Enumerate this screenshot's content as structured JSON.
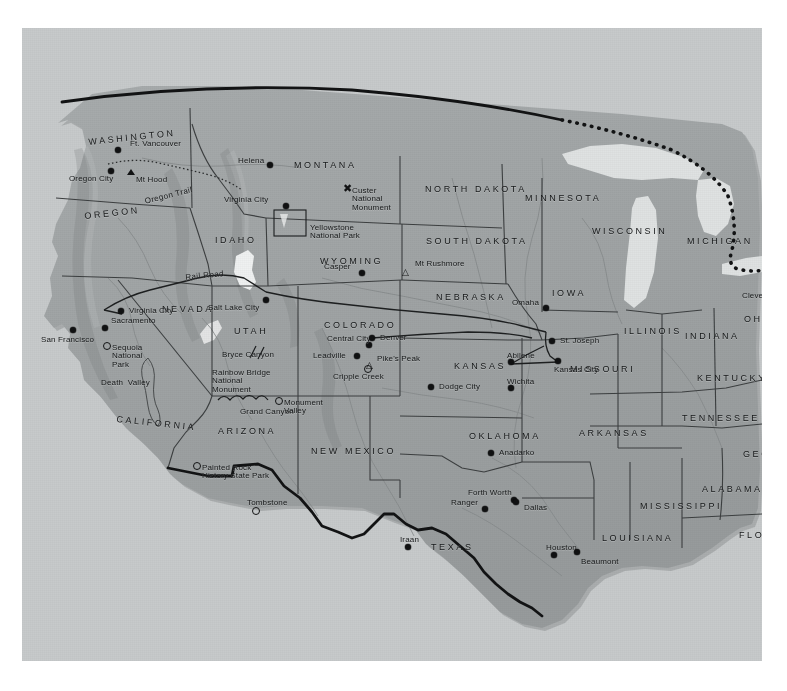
{
  "map": {
    "title": "Relief map of the western and central United States",
    "panel": {
      "x": 22,
      "y": 28,
      "w": 740,
      "h": 633
    },
    "colors": {
      "land": "#9fa3a4",
      "ocean": "#c9cccd",
      "paper": "#b9bcbd",
      "border_line": "#121314",
      "state_line": "#3a3d3e",
      "river": "#8e9293",
      "lake": "#e8eaea",
      "label": "#17191a"
    },
    "states": [
      {
        "name": "WASHINGTON",
        "x": 66,
        "y": 110,
        "rot": -8,
        "size": "big"
      },
      {
        "name": "OREGON",
        "x": 62,
        "y": 184,
        "rot": -4,
        "size": "big"
      },
      {
        "name": "IDAHO",
        "x": 193,
        "y": 208,
        "rot": 0,
        "size": "big"
      },
      {
        "name": "MONTANA",
        "x": 272,
        "y": 133,
        "rot": 0,
        "size": "big"
      },
      {
        "name": "NORTH DAKOTA",
        "x": 403,
        "y": 157,
        "rot": 0,
        "size": "big"
      },
      {
        "name": "SOUTH DAKOTA",
        "x": 404,
        "y": 209,
        "rot": 0,
        "size": "big"
      },
      {
        "name": "MINNESOTA",
        "x": 503,
        "y": 166,
        "rot": 0,
        "size": "big"
      },
      {
        "name": "WISCONSIN",
        "x": 570,
        "y": 199,
        "rot": 0,
        "size": "big"
      },
      {
        "name": "MICHIGAN",
        "x": 665,
        "y": 209,
        "rot": 0,
        "size": "big"
      },
      {
        "name": "WYOMING",
        "x": 298,
        "y": 229,
        "rot": 0,
        "size": "big"
      },
      {
        "name": "NEBRASKA",
        "x": 414,
        "y": 265,
        "rot": 0,
        "size": "big"
      },
      {
        "name": "IOWA",
        "x": 530,
        "y": 261,
        "rot": 0,
        "size": "big"
      },
      {
        "name": "ILLINOIS",
        "x": 602,
        "y": 299,
        "rot": 0,
        "size": "big"
      },
      {
        "name": "INDIANA",
        "x": 663,
        "y": 304,
        "rot": 0,
        "size": "big"
      },
      {
        "name": "OHIO",
        "x": 722,
        "y": 287,
        "rot": 0,
        "size": "big"
      },
      {
        "name": "NEVADA",
        "x": 140,
        "y": 277,
        "rot": 0,
        "size": "big"
      },
      {
        "name": "UTAH",
        "x": 212,
        "y": 299,
        "rot": 0,
        "size": "big"
      },
      {
        "name": "COLORADO",
        "x": 302,
        "y": 293,
        "rot": 0,
        "size": "big"
      },
      {
        "name": "KANSAS",
        "x": 432,
        "y": 334,
        "rot": 0,
        "size": "big"
      },
      {
        "name": "MISSOURI",
        "x": 548,
        "y": 337,
        "rot": 0,
        "size": "big"
      },
      {
        "name": "KENTUCKY",
        "x": 675,
        "y": 346,
        "rot": 0,
        "size": "big"
      },
      {
        "name": "CALIFORNIA",
        "x": 95,
        "y": 387,
        "rot": 5,
        "size": "big"
      },
      {
        "name": "ARIZONA",
        "x": 196,
        "y": 399,
        "rot": 0,
        "size": "big"
      },
      {
        "name": "NEW MEXICO",
        "x": 289,
        "y": 419,
        "rot": 0,
        "size": "big"
      },
      {
        "name": "OKLAHOMA",
        "x": 447,
        "y": 404,
        "rot": 0,
        "size": "big"
      },
      {
        "name": "ARKANSAS",
        "x": 557,
        "y": 401,
        "rot": 0,
        "size": "big"
      },
      {
        "name": "TENNESSEE",
        "x": 660,
        "y": 386,
        "rot": 0,
        "size": "big"
      },
      {
        "name": "GEORGIA",
        "x": 721,
        "y": 422,
        "rot": 0,
        "size": "big"
      },
      {
        "name": "ALABAMA",
        "x": 680,
        "y": 457,
        "rot": 0,
        "size": "big"
      },
      {
        "name": "MISSISSIPPI",
        "x": 618,
        "y": 474,
        "rot": 0,
        "size": "big"
      },
      {
        "name": "LOUISIANA",
        "x": 580,
        "y": 506,
        "rot": 0,
        "size": "big"
      },
      {
        "name": "FLORIDA",
        "x": 717,
        "y": 503,
        "rot": 0,
        "size": "big"
      },
      {
        "name": "TEXAS",
        "x": 409,
        "y": 515,
        "rot": 0,
        "size": "big"
      }
    ],
    "cities": [
      {
        "name": "Ft. Vancouver",
        "x": 96,
        "y": 122,
        "lx": 12,
        "ly": -10,
        "marker": "dot"
      },
      {
        "name": "Oregon City",
        "x": 89,
        "y": 143,
        "lx": -42,
        "ly": 4,
        "marker": "dot"
      },
      {
        "name": "Mt Hood",
        "x": 108,
        "y": 144,
        "lx": 6,
        "ly": 4,
        "marker": "triangle"
      },
      {
        "name": "Helena",
        "x": 248,
        "y": 137,
        "lx": -32,
        "ly": -8,
        "marker": "dot"
      },
      {
        "name": "Virginia City",
        "x": 264,
        "y": 178,
        "lx": -62,
        "ly": -10,
        "marker": "dot"
      },
      {
        "name": "Casper",
        "x": 340,
        "y": 245,
        "lx": -38,
        "ly": -10,
        "marker": "dot"
      },
      {
        "name": "Mt Rushmore",
        "x": 383,
        "y": 236,
        "lx": 10,
        "ly": -4,
        "marker": "triangle-open"
      },
      {
        "name": "Salt Lake City",
        "x": 244,
        "y": 272,
        "lx": -58,
        "ly": 4,
        "marker": "dot"
      },
      {
        "name": "Virginia City",
        "x": 99,
        "y": 283,
        "lx": 8,
        "ly": -4,
        "marker": "dot"
      },
      {
        "name": "Sacramento",
        "x": 83,
        "y": 300,
        "lx": 6,
        "ly": -11,
        "marker": "dot"
      },
      {
        "name": "San Francisco",
        "x": 51,
        "y": 302,
        "lx": -32,
        "ly": 6,
        "marker": "dot"
      },
      {
        "name": "Omaha",
        "x": 524,
        "y": 280,
        "lx": -34,
        "ly": -9,
        "marker": "dot"
      },
      {
        "name": "St. Joseph",
        "x": 530,
        "y": 313,
        "lx": 8,
        "ly": -4,
        "marker": "dot"
      },
      {
        "name": "Kansas City",
        "x": 536,
        "y": 333,
        "lx": -4,
        "ly": 5,
        "marker": "dot"
      },
      {
        "name": "Abilene",
        "x": 489,
        "y": 334,
        "lx": -4,
        "ly": -10,
        "marker": "dot"
      },
      {
        "name": "Wichita",
        "x": 489,
        "y": 360,
        "lx": -4,
        "ly": -10,
        "marker": "dot"
      },
      {
        "name": "Dodge City",
        "x": 409,
        "y": 359,
        "lx": 8,
        "ly": -4,
        "marker": "dot"
      },
      {
        "name": "Central City",
        "x": 347,
        "y": 317,
        "lx": -42,
        "ly": -10,
        "marker": "dot"
      },
      {
        "name": "Denver",
        "x": 350,
        "y": 310,
        "lx": 8,
        "ly": 0,
        "marker": "dot"
      },
      {
        "name": "Leadville",
        "x": 335,
        "y": 328,
        "lx": -44,
        "ly": -4,
        "marker": "dot"
      },
      {
        "name": "Pike's Peak",
        "x": 347,
        "y": 329,
        "lx": 8,
        "ly": -2,
        "marker": "triangle-open"
      },
      {
        "name": "Cripple Creek",
        "x": 345,
        "y": 340,
        "lx": -34,
        "ly": 5,
        "marker": "ring"
      },
      {
        "name": "Anadarko",
        "x": 469,
        "y": 425,
        "lx": 8,
        "ly": -4,
        "marker": "dot"
      },
      {
        "name": "Forth Worth",
        "x": 492,
        "y": 472,
        "lx": -46,
        "ly": -11,
        "marker": "dot"
      },
      {
        "name": "Ranger",
        "x": 463,
        "y": 481,
        "lx": -34,
        "ly": -10,
        "marker": "dot"
      },
      {
        "name": "Dallas",
        "x": 494,
        "y": 474,
        "lx": 8,
        "ly": 2,
        "marker": "dot"
      },
      {
        "name": "Houston",
        "x": 532,
        "y": 527,
        "lx": -8,
        "ly": -11,
        "marker": "dot"
      },
      {
        "name": "Beaumont",
        "x": 555,
        "y": 524,
        "lx": 4,
        "ly": 6,
        "marker": "dot"
      },
      {
        "name": "Iraan",
        "x": 386,
        "y": 519,
        "lx": -8,
        "ly": -11,
        "marker": "dot"
      },
      {
        "name": "Cleveland",
        "x": 744,
        "y": 259,
        "lx": -24,
        "ly": 5,
        "marker": "dot"
      },
      {
        "name": "Tombstone",
        "x": 233,
        "y": 482,
        "lx": -8,
        "ly": -11,
        "marker": "ring"
      }
    ],
    "features": [
      {
        "name": "Custer\nNational\nMonument",
        "x": 330,
        "y": 159,
        "marker": "x"
      },
      {
        "name": "Yellowstone\nNational Park",
        "x": 288,
        "y": 196,
        "marker": "none"
      },
      {
        "name": "Bryce Canyon",
        "x": 200,
        "y": 323,
        "marker": "none"
      },
      {
        "name": "Rainbow Bridge\nNational\nMonument",
        "x": 190,
        "y": 341,
        "marker": "none"
      },
      {
        "name": "Grand Canyon",
        "x": 218,
        "y": 380,
        "marker": "none"
      },
      {
        "name": "Monument\nValley",
        "x": 262,
        "y": 371,
        "marker": "ring"
      },
      {
        "name": "Sequoia\nNational\nPark",
        "x": 90,
        "y": 316,
        "marker": "ring"
      },
      {
        "name": "Death  Valley",
        "x": 79,
        "y": 351,
        "marker": "none"
      },
      {
        "name": "Painted Rock\nHistory State Park",
        "x": 180,
        "y": 436,
        "marker": "ring"
      }
    ],
    "trails": [
      {
        "name": "Oregon Trail",
        "x": 122,
        "y": 170,
        "rot": -14
      },
      {
        "name": "Rail Road",
        "x": 163,
        "y": 246,
        "rot": -8
      }
    ]
  }
}
